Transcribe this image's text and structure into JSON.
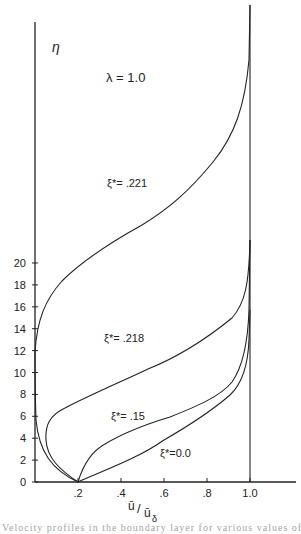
{
  "chart_data": {
    "type": "line",
    "title": "",
    "annotation": "λ = 1.0",
    "xlabel": "ū/ū_δ",
    "ylabel": "η",
    "xlim": [
      0,
      1.2
    ],
    "ylim": [
      0,
      21
    ],
    "x_ticks": [
      ".2",
      ".4",
      ".6",
      ".8",
      "1.0"
    ],
    "y_ticks": [
      "0",
      "2",
      "4",
      "6",
      "8",
      "10",
      "12",
      "14",
      "16",
      "18",
      "20"
    ],
    "grid": false,
    "legend": "inline labels",
    "series": [
      {
        "name": "ξ* = 0.0",
        "label": "ξ*=0.0",
        "points": [
          [
            0.2,
            0
          ],
          [
            0.3,
            0.5
          ],
          [
            0.45,
            1.2
          ],
          [
            0.6,
            2.0
          ],
          [
            0.75,
            2.8
          ],
          [
            0.88,
            3.6
          ],
          [
            0.96,
            4.6
          ],
          [
            0.99,
            5.8
          ],
          [
            1.0,
            7.8
          ],
          [
            1.0,
            20.5
          ]
        ]
      },
      {
        "name": "ξ* = .15",
        "label": "ξ*=.15",
        "points": [
          [
            0.2,
            0
          ],
          [
            0.25,
            0.9
          ],
          [
            0.33,
            1.6
          ],
          [
            0.45,
            2.3
          ],
          [
            0.6,
            2.9
          ],
          [
            0.75,
            3.6
          ],
          [
            0.88,
            4.8
          ],
          [
            0.96,
            6.3
          ],
          [
            0.99,
            7.8
          ],
          [
            1.0,
            11
          ],
          [
            1.0,
            20.5
          ]
        ]
      },
      {
        "name": "ξ* = .218",
        "label": "ξ*=.218",
        "points": [
          [
            0.2,
            0
          ],
          [
            0.12,
            0.5
          ],
          [
            0.06,
            1.2
          ],
          [
            0.05,
            2.0
          ],
          [
            0.07,
            2.6
          ],
          [
            0.14,
            3.3
          ],
          [
            0.3,
            4.3
          ],
          [
            0.5,
            5.3
          ],
          [
            0.68,
            6.3
          ],
          [
            0.84,
            7.5
          ],
          [
            0.95,
            8.6
          ],
          [
            0.99,
            9.6
          ],
          [
            1.0,
            11
          ],
          [
            1.0,
            20.5
          ]
        ]
      },
      {
        "name": "ξ* = .221",
        "label": "ξ*=.221",
        "points": [
          [
            0.2,
            0
          ],
          [
            0.08,
            0.5
          ],
          [
            0.02,
            1.5
          ],
          [
            0.0,
            3.5
          ],
          [
            0.0,
            6.0
          ],
          [
            0.03,
            7.5
          ],
          [
            0.12,
            9.2
          ],
          [
            0.3,
            10.8
          ],
          [
            0.5,
            12.2
          ],
          [
            0.68,
            13.6
          ],
          [
            0.83,
            15.5
          ],
          [
            0.93,
            17.2
          ],
          [
            0.98,
            18.6
          ],
          [
            1.0,
            19.6
          ],
          [
            1.0,
            20.5
          ]
        ]
      }
    ]
  },
  "labels": {
    "eta": "η",
    "lambda": "λ = 1.0",
    "xaxis_num": "ū",
    "xaxis_den": "ū",
    "xaxis_sub": "δ",
    "curve_221": "ξ*= .221",
    "curve_218": "ξ*= .218",
    "curve_15": "ξ*= .15",
    "curve_00": "ξ*=0.0",
    "caption": "Velocity profiles in the boundary layer for various values of ξ*"
  },
  "axis": {
    "y_ticks": [
      "0",
      "2",
      "4",
      "6",
      "8",
      "10",
      "12",
      "14",
      "16",
      "18",
      "20"
    ],
    "x_ticks": [
      ".2",
      ".4",
      ".6",
      ".8",
      "1.0"
    ]
  }
}
